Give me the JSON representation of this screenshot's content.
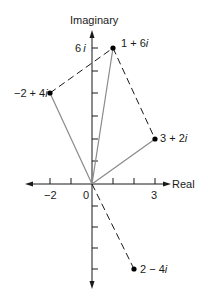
{
  "diagram": {
    "axes": {
      "x_label": "Real",
      "y_label": "Imaginary",
      "x_ticks": [
        "−2",
        "0",
        "3"
      ],
      "y_tick_label": "6i",
      "origin_label": "0"
    },
    "points": [
      {
        "label": "1 + 6i",
        "re": 1,
        "im": 6
      },
      {
        "label": "−2 + 4i",
        "re": -2,
        "im": 4
      },
      {
        "label": "3 + 2i",
        "re": 3,
        "im": 2
      },
      {
        "label": "2 − 4i",
        "re": 2,
        "im": -4
      }
    ],
    "colors": {
      "axis": "#1a1a1a",
      "vector": "#8a8a8a",
      "dashed": "#1a1a1a",
      "point": "#000000"
    }
  },
  "labels": {
    "imaginary": "Imaginary",
    "real": "Real",
    "six_i": "6",
    "i": "i",
    "neg_two": "−2",
    "zero": "0",
    "three": "3",
    "p1_a": "1 + 6",
    "p2_a": "−2 + 4",
    "p3_a": "3 + 2",
    "p4_a": "2 − 4"
  }
}
